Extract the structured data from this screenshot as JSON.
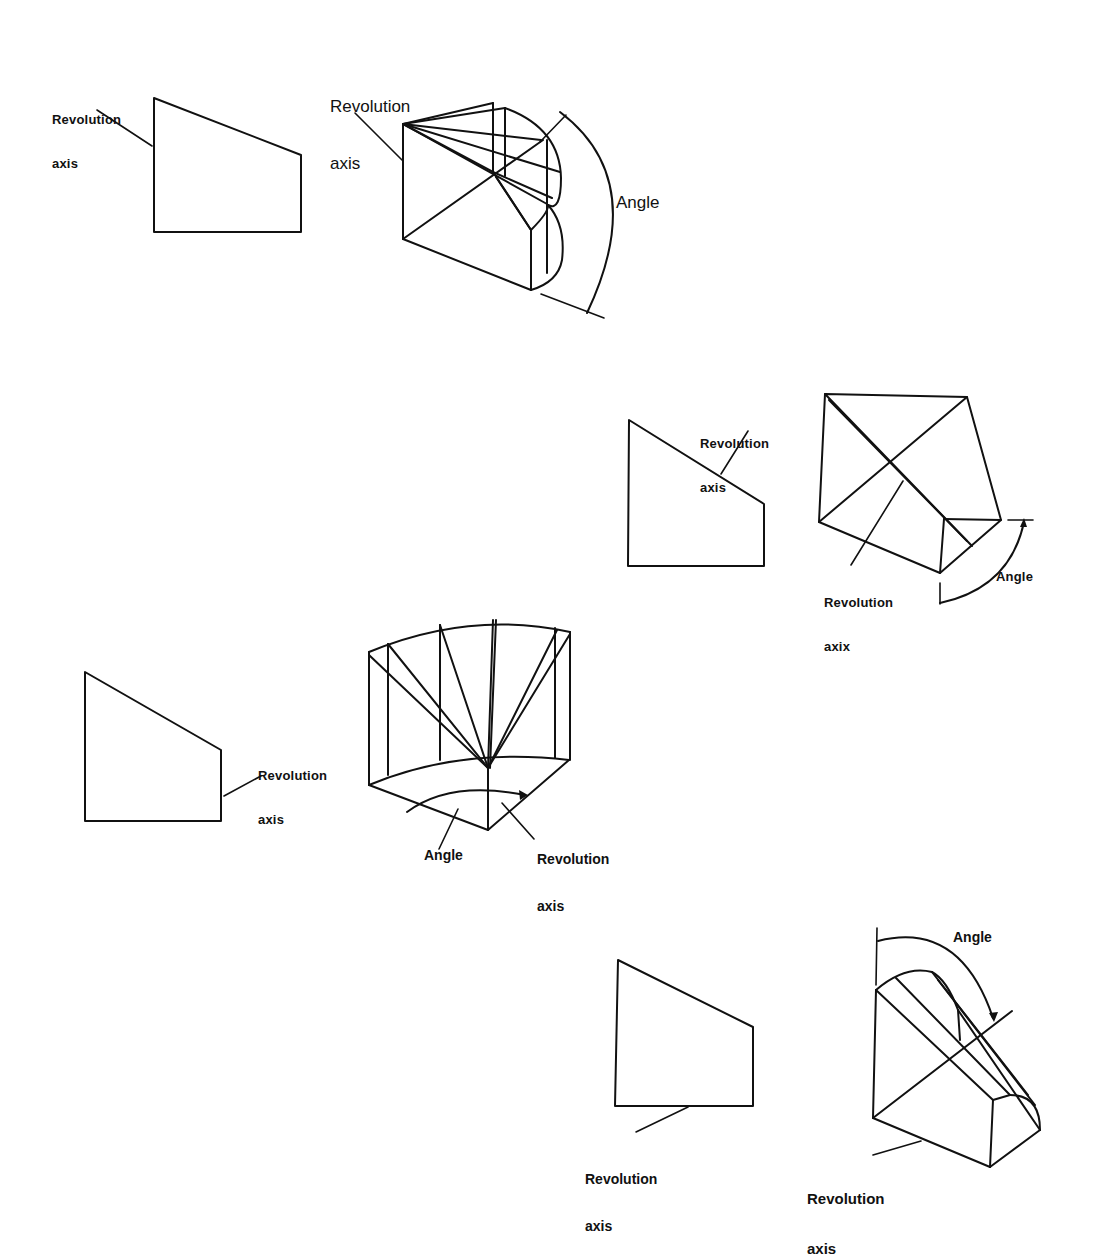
{
  "figure": {
    "stroke_color": "#111111",
    "background": "#ffffff",
    "examples": [
      {
        "id": 1,
        "description": "Profile revolved about its left vertical edge",
        "profile_label": {
          "line1": "Revolution",
          "line2": "axis"
        },
        "solid_label": {
          "line1": "Revolution",
          "line2": "axis"
        },
        "angle_label": "Angle"
      },
      {
        "id": 2,
        "description": "Profile revolved about its sloped top edge",
        "profile_label": {
          "line1": "Revolution",
          "line2": "axis"
        },
        "solid_label": {
          "line1": "Revolution",
          "line2": "axix"
        },
        "angle_label": "Angle"
      },
      {
        "id": 3,
        "description": "Profile revolved about an axis offset to the right",
        "profile_label": {
          "line1": "Revolution",
          "line2": "axis"
        },
        "solid_label": {
          "line1": "Revolution",
          "line2": "axis"
        },
        "angle_label": "Angle"
      },
      {
        "id": 4,
        "description": "Profile revolved about its bottom edge",
        "profile_label": {
          "line1": "Revolution",
          "line2": "axis"
        },
        "solid_label": {
          "line1": "Revolution",
          "line2": "axis"
        },
        "angle_label": "Angle"
      }
    ]
  }
}
